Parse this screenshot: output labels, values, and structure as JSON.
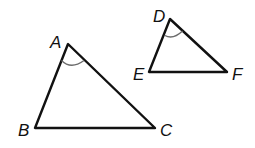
{
  "diagram": {
    "triangles": [
      {
        "name": "ABC",
        "vertices": [
          {
            "label": "A",
            "x": 68,
            "y": 44,
            "lx": 50,
            "ly": 48
          },
          {
            "label": "B",
            "x": 35,
            "y": 128,
            "lx": 18,
            "ly": 136
          },
          {
            "label": "C",
            "x": 155,
            "y": 128,
            "lx": 160,
            "ly": 136
          }
        ],
        "angle_mark": {
          "vertex": "A",
          "path": "M 61.5 60.5 Q 71 70 84 60.5"
        }
      },
      {
        "name": "DEF",
        "vertices": [
          {
            "label": "D",
            "x": 170,
            "y": 19,
            "lx": 153,
            "ly": 22
          },
          {
            "label": "E",
            "x": 149,
            "y": 72,
            "lx": 133,
            "ly": 80
          },
          {
            "label": "F",
            "x": 227,
            "y": 72,
            "lx": 232,
            "ly": 80
          }
        ],
        "angle_mark": {
          "vertex": "D",
          "path": "M 165 35.5 Q 173 40 182.5 31"
        }
      }
    ],
    "colors": {
      "edge": "#111111",
      "angle_arc": "#6b6b6b"
    }
  }
}
